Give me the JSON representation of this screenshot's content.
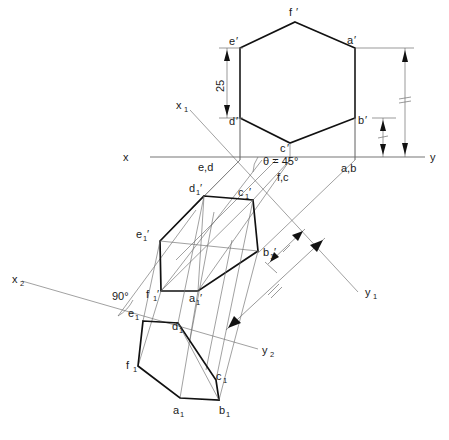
{
  "drawing": {
    "title": "Orthographic projection of a hexagonal lamina inclined at 45 degrees",
    "background_color": "#ffffff",
    "line_color": "#111111",
    "thin_line_color": "#6e6e6e",
    "width": 449,
    "height": 440
  },
  "axes": {
    "x_label": "x",
    "y_label": "y",
    "x1_label": "x",
    "x1_sub": "1",
    "y1_label": "y",
    "y1_sub": "1",
    "x2_label": "x",
    "x2_sub": "2",
    "y2_label": "y",
    "y2_sub": "2"
  },
  "angles": {
    "theta": "θ = 45°",
    "right_angle": "90°"
  },
  "dimensions": {
    "side_length": "25"
  },
  "front_view": {
    "name": "front-view-hexagon",
    "vertices": [
      {
        "label": "f",
        "prime": "′"
      },
      {
        "label": "a",
        "prime": "′"
      },
      {
        "label": "b",
        "prime": "′"
      },
      {
        "label": "c",
        "prime": "′"
      },
      {
        "label": "d",
        "prime": "′"
      },
      {
        "label": "e",
        "prime": "′"
      }
    ]
  },
  "ground_line_labels": [
    {
      "text": "e,d"
    },
    {
      "text": "f,c"
    },
    {
      "text": "a,b"
    }
  ],
  "inclined_view": {
    "name": "inclined-hexagon",
    "vertices": [
      {
        "label": "d",
        "sub": "1",
        "prime": "′"
      },
      {
        "label": "c",
        "sub": "1",
        "prime": "′"
      },
      {
        "label": "b",
        "sub": "1",
        "prime": "′"
      },
      {
        "label": "a",
        "sub": "1",
        "prime": "′"
      },
      {
        "label": "f",
        "sub": "1",
        "prime": "′"
      },
      {
        "label": "e",
        "sub": "1",
        "prime": "′"
      }
    ]
  },
  "top_view": {
    "name": "top-view-hexagon",
    "vertices": [
      {
        "label": "e",
        "sub": "1"
      },
      {
        "label": "d",
        "sub": "1"
      },
      {
        "label": "c",
        "sub": "1"
      },
      {
        "label": "b",
        "sub": "1"
      },
      {
        "label": "a",
        "sub": "1"
      },
      {
        "label": "f",
        "sub": "1"
      }
    ]
  }
}
